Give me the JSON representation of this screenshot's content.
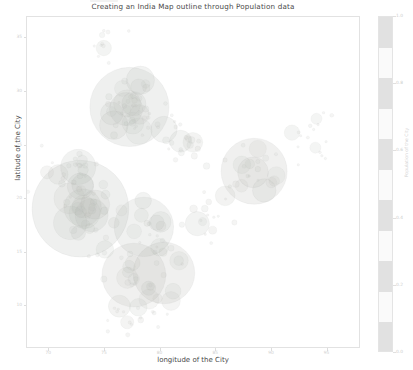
{
  "figure": {
    "background_color": "#ffffff",
    "width": 413,
    "height": 370
  },
  "title": "Creating an India Map outline through Population data",
  "axes": {
    "xlabel": "longitude of the City",
    "ylabel": "latitude of the City",
    "frame_color": "#e2e2e2"
  },
  "colorbar": {
    "label": "Population of the City",
    "ticks": [
      "0.0",
      "0.2",
      "0.4",
      "0.6",
      "0.8",
      "1.0"
    ],
    "band_color": "#d8d8d8"
  },
  "chart_data": {
    "type": "scatter",
    "title": "Creating an India Map outline through Population data",
    "xlabel": "longitude of the City",
    "ylabel": "latitude of the City",
    "grid": false,
    "legend": false,
    "colorbar_label": "Population of the City",
    "xlim": [
      68,
      98
    ],
    "ylim": [
      6,
      37
    ],
    "xticks": [
      70,
      75,
      80,
      85,
      90,
      95
    ],
    "yticks": [
      10,
      15,
      20,
      25,
      30,
      35
    ],
    "marker_color": "#b9c2b4",
    "marker_alpha": 0.16,
    "size_encodes": "population",
    "color_encodes": "population",
    "points": [
      {
        "x": 77.2,
        "y": 28.6,
        "size": 72,
        "pop": 0.98
      },
      {
        "x": 76.9,
        "y": 28.4,
        "size": 30,
        "pop": 0.62
      },
      {
        "x": 77.6,
        "y": 28.9,
        "size": 22,
        "pop": 0.48
      },
      {
        "x": 78.1,
        "y": 27.9,
        "size": 18,
        "pop": 0.4
      },
      {
        "x": 75.8,
        "y": 26.9,
        "size": 26,
        "pop": 0.55
      },
      {
        "x": 80.3,
        "y": 26.5,
        "size": 24,
        "pop": 0.52
      },
      {
        "x": 81.8,
        "y": 25.4,
        "size": 20,
        "pop": 0.44
      },
      {
        "x": 82.9,
        "y": 25.3,
        "size": 18,
        "pop": 0.4
      },
      {
        "x": 72.8,
        "y": 19.1,
        "size": 88,
        "pop": 1.0
      },
      {
        "x": 73.0,
        "y": 19.2,
        "size": 34,
        "pop": 0.66
      },
      {
        "x": 73.8,
        "y": 18.5,
        "size": 30,
        "pop": 0.6
      },
      {
        "x": 72.6,
        "y": 23.0,
        "size": 32,
        "pop": 0.64
      },
      {
        "x": 72.8,
        "y": 21.2,
        "size": 24,
        "pop": 0.5
      },
      {
        "x": 88.4,
        "y": 22.6,
        "size": 60,
        "pop": 0.9
      },
      {
        "x": 88.3,
        "y": 22.5,
        "size": 28,
        "pop": 0.58
      },
      {
        "x": 87.3,
        "y": 23.2,
        "size": 16,
        "pop": 0.36
      },
      {
        "x": 85.8,
        "y": 20.3,
        "size": 18,
        "pop": 0.38
      },
      {
        "x": 80.3,
        "y": 13.1,
        "size": 56,
        "pop": 0.86
      },
      {
        "x": 77.6,
        "y": 12.9,
        "size": 58,
        "pop": 0.88
      },
      {
        "x": 78.5,
        "y": 17.4,
        "size": 54,
        "pop": 0.84
      },
      {
        "x": 76.3,
        "y": 10.0,
        "size": 20,
        "pop": 0.42
      },
      {
        "x": 75.0,
        "y": 15.3,
        "size": 16,
        "pop": 0.34
      },
      {
        "x": 79.9,
        "y": 15.5,
        "size": 16,
        "pop": 0.34
      },
      {
        "x": 83.3,
        "y": 17.7,
        "size": 22,
        "pop": 0.46
      },
      {
        "x": 74.9,
        "y": 34.1,
        "size": 14,
        "pop": 0.28
      },
      {
        "x": 91.8,
        "y": 26.2,
        "size": 14,
        "pop": 0.28
      },
      {
        "x": 94.0,
        "y": 27.5,
        "size": 10,
        "pop": 0.2
      },
      {
        "x": 93.9,
        "y": 24.8,
        "size": 10,
        "pop": 0.2
      },
      {
        "x": 70.8,
        "y": 22.3,
        "size": 18,
        "pop": 0.38
      },
      {
        "x": 69.8,
        "y": 22.5,
        "size": 12,
        "pop": 0.24
      },
      {
        "x": 78.0,
        "y": 9.9,
        "size": 16,
        "pop": 0.34
      },
      {
        "x": 77.0,
        "y": 8.5,
        "size": 12,
        "pop": 0.24
      }
    ]
  }
}
